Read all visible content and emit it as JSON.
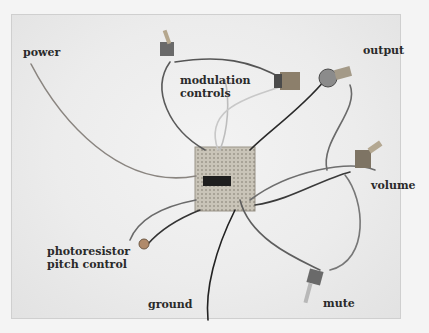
{
  "image": {
    "description": "Photo of a hand-wired electronic circuit on perfboard with labeled components",
    "labels": {
      "power": "power",
      "modulation_line1": "modulation",
      "modulation_line2": "controls",
      "output": "output",
      "volume": "volume",
      "photoresistor_line1": "photoresistor",
      "photoresistor_line2": "pitch control",
      "ground": "ground",
      "mute": "mute"
    }
  }
}
